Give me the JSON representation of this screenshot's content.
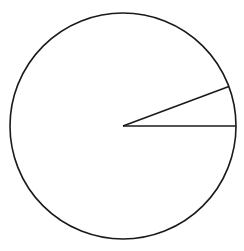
{
  "diagram": {
    "type": "circle-sector",
    "background": "#ffffff",
    "stroke_color": "#1a1a1a",
    "stroke_width": 1.6,
    "circle": {
      "cx": 123,
      "cy": 126,
      "r": 113
    },
    "sector": {
      "start_angle_deg": 0,
      "end_angle_deg": 20.5,
      "description": "Two radii drawn from the center: one horizontal to the right, one at roughly 20 degrees above horizontal"
    },
    "labels": []
  }
}
